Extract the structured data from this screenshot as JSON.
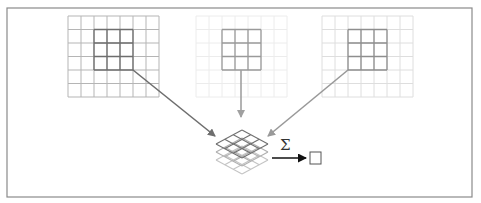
{
  "diagram": {
    "frame": {
      "x": 7,
      "y": 8,
      "w": 465,
      "h": 189,
      "color": "#8a8a8a"
    },
    "input_channels": [
      {
        "name": "channel-1",
        "x": 68,
        "y": 16,
        "cols": 7,
        "rows": 6,
        "cell_w": 13,
        "cell_h": 13.5,
        "grid_color": "#b5b5b5",
        "kernel_color": "#6e6e6e",
        "kernel_col": 2,
        "kernel_row": 1,
        "kernel_size": 3,
        "arrow": {
          "x1": 133,
          "y1": 70,
          "x2": 215,
          "y2": 136,
          "color": "#6e6e6e"
        }
      },
      {
        "name": "channel-2",
        "x": 196,
        "y": 16,
        "cols": 7,
        "rows": 6,
        "cell_w": 13,
        "cell_h": 13.5,
        "grid_color": "#ececec",
        "kernel_color": "#9a9a9a",
        "kernel_col": 2,
        "kernel_row": 1,
        "kernel_size": 3,
        "arrow": {
          "x1": 241,
          "y1": 70,
          "x2": 241,
          "y2": 117,
          "color": "#a0a0a0"
        }
      },
      {
        "name": "channel-3",
        "x": 322,
        "y": 16,
        "cols": 7,
        "rows": 6,
        "cell_w": 13,
        "cell_h": 13.5,
        "grid_color": "#dedede",
        "kernel_color": "#8e8e8e",
        "kernel_col": 2,
        "kernel_row": 1,
        "kernel_size": 3,
        "arrow": {
          "x1": 348,
          "y1": 70,
          "x2": 268,
          "y2": 136,
          "color": "#999999"
        }
      }
    ],
    "stack": {
      "cx": 242,
      "half_w": 26,
      "half_h": 14,
      "n": 3,
      "layers": [
        {
          "top_y": 146,
          "color": "#c4c4c4"
        },
        {
          "top_y": 138,
          "color": "#b0b0b0"
        },
        {
          "top_y": 130,
          "color": "#707070"
        }
      ]
    },
    "sum_symbol": "Σ",
    "sum_arrow": {
      "x1": 272,
      "y1": 158,
      "x2": 306,
      "y2": 158,
      "color": "#111111"
    },
    "output_box": {
      "x": 310,
      "y": 152,
      "w": 11,
      "h": 12,
      "color": "#555555"
    }
  }
}
